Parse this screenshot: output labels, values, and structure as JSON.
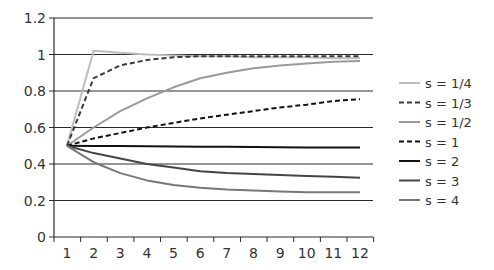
{
  "chart_data": {
    "type": "line",
    "title": "",
    "xlabel": "",
    "ylabel": "",
    "categories": [
      "1",
      "2",
      "3",
      "4",
      "5",
      "6",
      "7",
      "8",
      "9",
      "10",
      "11",
      "12"
    ],
    "ylim": [
      0,
      1.2
    ],
    "yticks": [
      "0",
      "0.2",
      "0.4",
      "0.6",
      "0.8",
      "1",
      "1.2"
    ],
    "ytick_values": [
      0,
      0.2,
      0.4,
      0.6,
      0.8,
      1.0,
      1.2
    ],
    "grid": true,
    "legend_position": "right",
    "series": [
      {
        "name": "s = 1/4",
        "color": "#bdbdbd",
        "dashed": false,
        "width": 2,
        "values": [
          0.5,
          1.02,
          1.01,
          1.0,
          0.995,
          0.99,
          0.99,
          0.985,
          0.985,
          0.985,
          0.98,
          0.98
        ]
      },
      {
        "name": "s = 1/3",
        "color": "#3a3a3a",
        "dashed": true,
        "width": 2,
        "values": [
          0.5,
          0.87,
          0.94,
          0.97,
          0.985,
          0.99,
          0.99,
          0.99,
          0.99,
          0.99,
          0.99,
          0.99
        ]
      },
      {
        "name": "s = 1/2",
        "color": "#9a9a9a",
        "dashed": false,
        "width": 2,
        "values": [
          0.5,
          0.6,
          0.69,
          0.76,
          0.82,
          0.87,
          0.9,
          0.925,
          0.94,
          0.95,
          0.96,
          0.965
        ]
      },
      {
        "name": "s = 1",
        "color": "#111111",
        "dashed": true,
        "width": 2,
        "values": [
          0.5,
          0.54,
          0.57,
          0.6,
          0.625,
          0.65,
          0.67,
          0.69,
          0.71,
          0.725,
          0.745,
          0.755
        ]
      },
      {
        "name": "s = 2",
        "color": "#111111",
        "dashed": false,
        "width": 2,
        "values": [
          0.5,
          0.499,
          0.498,
          0.497,
          0.496,
          0.495,
          0.494,
          0.493,
          0.492,
          0.491,
          0.49,
          0.49
        ]
      },
      {
        "name": "s = 3",
        "color": "#444444",
        "dashed": false,
        "width": 2,
        "values": [
          0.5,
          0.46,
          0.43,
          0.4,
          0.38,
          0.36,
          0.35,
          0.345,
          0.34,
          0.335,
          0.33,
          0.325
        ]
      },
      {
        "name": "s = 4",
        "color": "#777777",
        "dashed": false,
        "width": 2,
        "values": [
          0.5,
          0.41,
          0.35,
          0.31,
          0.285,
          0.27,
          0.26,
          0.255,
          0.25,
          0.245,
          0.245,
          0.245
        ]
      }
    ]
  }
}
